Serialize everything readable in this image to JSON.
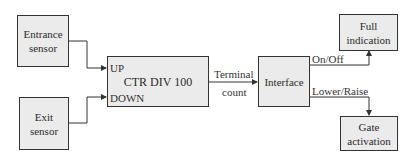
{
  "blocks": {
    "entrance_sensor": {
      "line1": "Entrance",
      "line2": "sensor"
    },
    "exit_sensor": {
      "line1": "Exit",
      "line2": "sensor"
    },
    "counter": {
      "title": "CTR DIV 100",
      "up_label": "UP",
      "down_label": "DOWN"
    },
    "interface": {
      "label": "Interface"
    },
    "full_indication": {
      "line1": "Full",
      "line2": "indication"
    },
    "gate_activation": {
      "line1": "Gate",
      "line2": "activation"
    }
  },
  "signals": {
    "terminal_count_line1": "Terminal",
    "terminal_count_line2": "count",
    "on_off": "On/Off",
    "lower_raise": "Lower/Raise"
  },
  "colors": {
    "box_fill": "#ebebeb",
    "line": "#333333"
  }
}
